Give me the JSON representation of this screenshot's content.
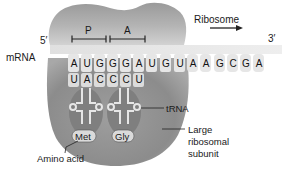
{
  "labels": {
    "five_prime": "5′",
    "three_prime": "3′",
    "mrna": "mRNA",
    "ribosome": "Ribosome",
    "p_site": "P",
    "a_site": "A",
    "trna": "tRNA",
    "large_subunit_line1": "Large",
    "large_subunit_line2": "ribosomal",
    "large_subunit_line3": "subunit",
    "amino_acid": "Amino acid"
  },
  "mrna_codons": [
    "A",
    "U",
    "G",
    "G",
    "G",
    "A",
    "U",
    "G",
    "U",
    "A",
    "A",
    "G",
    "C",
    "G",
    "A"
  ],
  "anticodons": [
    "U",
    "A",
    "C",
    "C",
    "C",
    "U"
  ],
  "amino_acids": [
    "Met",
    "Gly"
  ],
  "colors": {
    "subunit_dark": "#8e8e8e",
    "subunit_light": "#c8c8c8",
    "mrna_strip": "#e4e4e4",
    "trna_fill": "#7d7d7d",
    "aa_fill": "#d9d9d9"
  }
}
